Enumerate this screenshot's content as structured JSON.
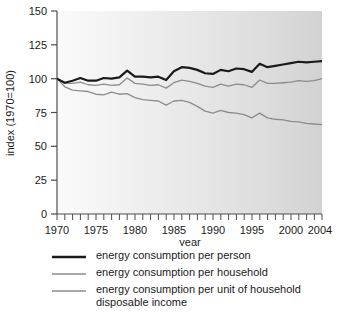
{
  "chart_data": {
    "type": "line",
    "title": "",
    "xlabel": "year",
    "ylabel": "index (1970=100)",
    "xlim": [
      1970,
      2004
    ],
    "ylim": [
      0,
      150
    ],
    "yticks": [
      0,
      25,
      50,
      75,
      100,
      125,
      150
    ],
    "ytick_labels": [
      "0",
      "25",
      "50",
      "75",
      "100",
      "125",
      "150"
    ],
    "xticks": [
      1970,
      1975,
      1980,
      1985,
      1990,
      1995,
      2000,
      2004
    ],
    "xtick_labels": [
      "1970",
      "1975",
      "1980",
      "1985",
      "1990",
      "1995",
      "2000",
      "2004"
    ],
    "minor_xticks_every": 1,
    "grid": false,
    "legend_position": "below",
    "x": [
      1970,
      1971,
      1972,
      1973,
      1974,
      1975,
      1976,
      1977,
      1978,
      1979,
      1980,
      1981,
      1982,
      1983,
      1984,
      1985,
      1986,
      1987,
      1988,
      1989,
      1990,
      1991,
      1992,
      1993,
      1994,
      1995,
      1996,
      1997,
      1998,
      1999,
      2000,
      2001,
      2002,
      2003,
      2004
    ],
    "series": [
      {
        "name": "energy consumption per person",
        "color": "#1a1a1a",
        "width": 2.2,
        "values": [
          100,
          97,
          98.5,
          100.5,
          98.5,
          98.5,
          100.5,
          100,
          101,
          106,
          101.5,
          101.5,
          101,
          101.5,
          99,
          105.5,
          108.5,
          108,
          106.5,
          104,
          103.5,
          106.5,
          105.5,
          107.5,
          107,
          105,
          111,
          108.5,
          109.5,
          110.5,
          111.5,
          112.5,
          112,
          112.5,
          113
        ]
      },
      {
        "name": "energy consumption per household",
        "color": "#8c8c8c",
        "width": 1.3,
        "values": [
          100,
          96.5,
          96.5,
          97.5,
          95.5,
          95,
          96,
          95,
          95.5,
          100.5,
          96.5,
          96,
          95,
          95.5,
          93,
          97,
          99,
          98,
          96.5,
          94.5,
          93.5,
          96,
          94.5,
          96,
          95.5,
          93.5,
          99,
          96.5,
          96.5,
          97,
          97.5,
          98.5,
          98,
          98.5,
          100
        ]
      },
      {
        "name": "energy consumption per unit of household\ndisposable income",
        "color": "#8c8c8c",
        "width": 1.3,
        "values": [
          100,
          94,
          91.5,
          91,
          90.5,
          88.5,
          88,
          90,
          88.5,
          89,
          86,
          84.5,
          84,
          83.5,
          80.5,
          83.5,
          84,
          82.5,
          79.5,
          76,
          74.5,
          76.5,
          75,
          74.5,
          73.5,
          71,
          74.5,
          71,
          70,
          69.5,
          68.5,
          68,
          67,
          66.5,
          66
        ]
      }
    ]
  },
  "legend": {
    "items": [
      {
        "label": "energy consumption per person"
      },
      {
        "label": "energy consumption per household"
      },
      {
        "label": "energy consumption per unit of household\ndisposable income"
      }
    ]
  },
  "axes": {
    "x_title": "year",
    "y_title": "index (1970=100)"
  },
  "colors": {
    "line_dark": "#1a1a1a",
    "line_gray": "#8c8c8c",
    "axis": "#4d4d4d",
    "plot_bg_left": "#f7f7f7",
    "plot_bg_right": "#d4d4d4",
    "page_bg": "#ffffff"
  }
}
